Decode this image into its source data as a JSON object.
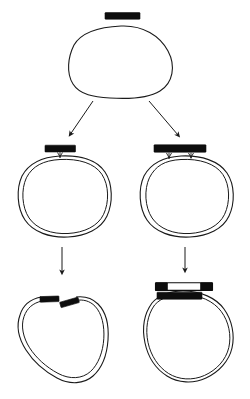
{
  "figure": {
    "title": "",
    "background_color": "#ffffff",
    "ink_color": "#1a1a1a",
    "fill_black": "#0d0d0d",
    "width": 250,
    "height": 399
  },
  "panels": [
    {
      "id": "parent",
      "name": "parent-circle",
      "label": "",
      "loop_style": "single-line",
      "bound_bar": {
        "name": "black-bar-detached",
        "style": "solid-black",
        "position": "above-loop",
        "legs": 0,
        "label": ""
      }
    },
    {
      "id": "daughter-left",
      "name": "left-daughter-circle",
      "label": "",
      "loop_style": "double-line",
      "bound_bar": {
        "name": "black-bar-single-leg",
        "style": "solid-black",
        "position": "on-loop-top",
        "legs": 1,
        "label": ""
      }
    },
    {
      "id": "daughter-right",
      "name": "right-daughter-circle",
      "label": "",
      "loop_style": "double-line",
      "bound_bar": {
        "name": "black-bar-double-leg",
        "style": "solid-black",
        "position": "on-loop-top",
        "legs": 2,
        "label": ""
      }
    },
    {
      "id": "product-left",
      "name": "left-product-circle",
      "label": "",
      "loop_style": "double-line-gapped",
      "bound_bar": {
        "name": "staggered-black-segments",
        "style": "two-offset-solid-segments",
        "position": "on-loop-top-gap",
        "legs": 0,
        "label": ""
      }
    },
    {
      "id": "product-right",
      "name": "right-product-circle",
      "label": "",
      "loop_style": "double-line",
      "bound_bar": {
        "name": "black-bar-on-loop",
        "style": "solid-black",
        "position": "on-loop-top",
        "legs": 0,
        "label": ""
      },
      "released_fragment": {
        "name": "released-fragment-bar",
        "style": "hollow-with-black-ends",
        "position": "above-loop",
        "label": ""
      }
    }
  ],
  "arrows": [
    {
      "name": "arrow-parent-to-left-daughter",
      "direction": "down-left",
      "label": ""
    },
    {
      "name": "arrow-parent-to-right-daughter",
      "direction": "down-right",
      "label": ""
    },
    {
      "name": "arrow-left-daughter-to-left-product",
      "direction": "down",
      "label": ""
    },
    {
      "name": "arrow-right-daughter-to-right-product",
      "direction": "down",
      "label": ""
    }
  ]
}
